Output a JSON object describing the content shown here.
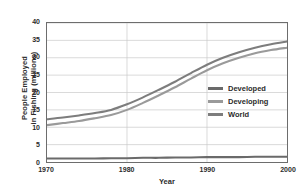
{
  "chart_data": {
    "type": "line",
    "title": "",
    "xlabel": "Year",
    "ylabel": "People Employed in Fishing (millions)",
    "xlim": [
      1970,
      2000
    ],
    "ylim": [
      0,
      40
    ],
    "grid": true,
    "legend_position": "center-right",
    "xticks": [
      "1970",
      "1980",
      "1990",
      "2000"
    ],
    "yticks": [
      "0",
      "5",
      "10",
      "15",
      "20",
      "25",
      "30",
      "35",
      "40"
    ],
    "x": [
      1970,
      1972,
      1974,
      1976,
      1978,
      1980,
      1982,
      1984,
      1986,
      1988,
      1990,
      1992,
      1994,
      1996,
      1998,
      2000
    ],
    "series": [
      {
        "name": "World",
        "color": "#7d7d7d",
        "values": [
          12.3,
          12.8,
          13.4,
          14.1,
          15.0,
          16.6,
          18.6,
          20.8,
          23.1,
          25.6,
          28.0,
          30.0,
          31.6,
          32.9,
          33.9,
          34.7
        ]
      },
      {
        "name": "Developing",
        "color": "#9a9a9a",
        "values": [
          10.6,
          11.2,
          11.8,
          12.6,
          13.5,
          15.0,
          17.0,
          19.2,
          21.5,
          24.0,
          26.4,
          28.4,
          30.0,
          31.3,
          32.2,
          32.9
        ]
      },
      {
        "name": "Developed",
        "color": "#6a6a6a",
        "values": [
          1.0,
          1.0,
          1.0,
          1.0,
          1.1,
          1.1,
          1.2,
          1.2,
          1.3,
          1.3,
          1.4,
          1.4,
          1.4,
          1.5,
          1.5,
          1.5
        ]
      }
    ]
  },
  "legend": {
    "entries": [
      {
        "label": "Developed",
        "color": "#6a6a6a"
      },
      {
        "label": "Developing",
        "color": "#9a9a9a"
      },
      {
        "label": "World",
        "color": "#7d7d7d"
      }
    ]
  },
  "axes": {
    "y_title_line1": "People Employed",
    "y_title_line2": "in Fishing (millions)",
    "x_title": "Year"
  }
}
